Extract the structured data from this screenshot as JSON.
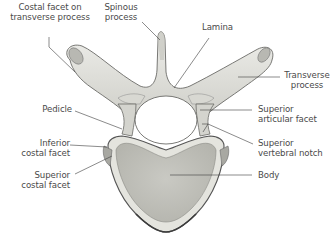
{
  "figure": {
    "colors": {
      "bone_fill": "#dcdcd6",
      "bone_light": "#ecece8",
      "bone_shadow": "#9a9a94",
      "outline": "#555555",
      "leader_line": "#3c3c3c",
      "label_text": "#4a4a4a",
      "background": "#ffffff"
    }
  },
  "labels": [
    {
      "id": "costal-facet-transverse",
      "lines": [
        "Costal facet on",
        "transverse process"
      ]
    },
    {
      "id": "spinous-process",
      "lines": [
        "Spinous",
        "process"
      ]
    },
    {
      "id": "lamina",
      "lines": [
        "Lamina"
      ]
    },
    {
      "id": "transverse-process",
      "lines": [
        "Transverse",
        "process"
      ]
    },
    {
      "id": "pedicle",
      "lines": [
        "Pedicle"
      ]
    },
    {
      "id": "superior-articular-facet",
      "lines": [
        "Superior",
        "articular facet"
      ]
    },
    {
      "id": "inferior-costal-facet",
      "lines": [
        "Inferior",
        "costal facet"
      ]
    },
    {
      "id": "superior-vertebral-notch",
      "lines": [
        "Superior",
        "vertebral notch"
      ]
    },
    {
      "id": "superior-costal-facet",
      "lines": [
        "Superior",
        "costal facet"
      ]
    },
    {
      "id": "body",
      "lines": [
        "Body"
      ]
    }
  ]
}
